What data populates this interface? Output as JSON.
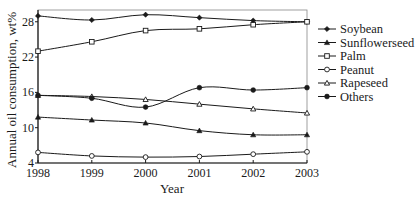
{
  "chart_data": {
    "type": "line",
    "title": "",
    "xlabel": "Year",
    "ylabel": "Annual oil consumption, wt%",
    "x": [
      1998,
      1999,
      2000,
      2001,
      2002,
      2003
    ],
    "xticks": [
      "1998",
      "1999",
      "2000",
      "2001",
      "2002",
      "2003"
    ],
    "yticks": [
      4,
      10,
      16,
      22,
      28
    ],
    "ylim": [
      4,
      30
    ],
    "grid": false,
    "legend_position": "right",
    "series": [
      {
        "name": "Soybean",
        "marker": "filled-diamond",
        "values": [
          29.0,
          28.3,
          29.2,
          28.7,
          28.2,
          28.0
        ]
      },
      {
        "name": "Sunflowerseed",
        "marker": "filled-triangle",
        "values": [
          11.8,
          11.3,
          10.8,
          9.5,
          8.8,
          8.8
        ]
      },
      {
        "name": "Palm",
        "marker": "open-square",
        "values": [
          23.0,
          24.6,
          26.5,
          26.8,
          27.5,
          28.0
        ]
      },
      {
        "name": "Peanut",
        "marker": "open-circle",
        "values": [
          5.8,
          5.2,
          5.0,
          5.1,
          5.5,
          5.9
        ]
      },
      {
        "name": "Rapeseed",
        "marker": "open-triangle",
        "values": [
          15.5,
          15.3,
          14.8,
          14.0,
          13.2,
          12.5
        ]
      },
      {
        "name": "Others",
        "marker": "filled-circle",
        "values": [
          15.5,
          15.0,
          13.5,
          16.8,
          16.4,
          16.8
        ]
      }
    ]
  }
}
